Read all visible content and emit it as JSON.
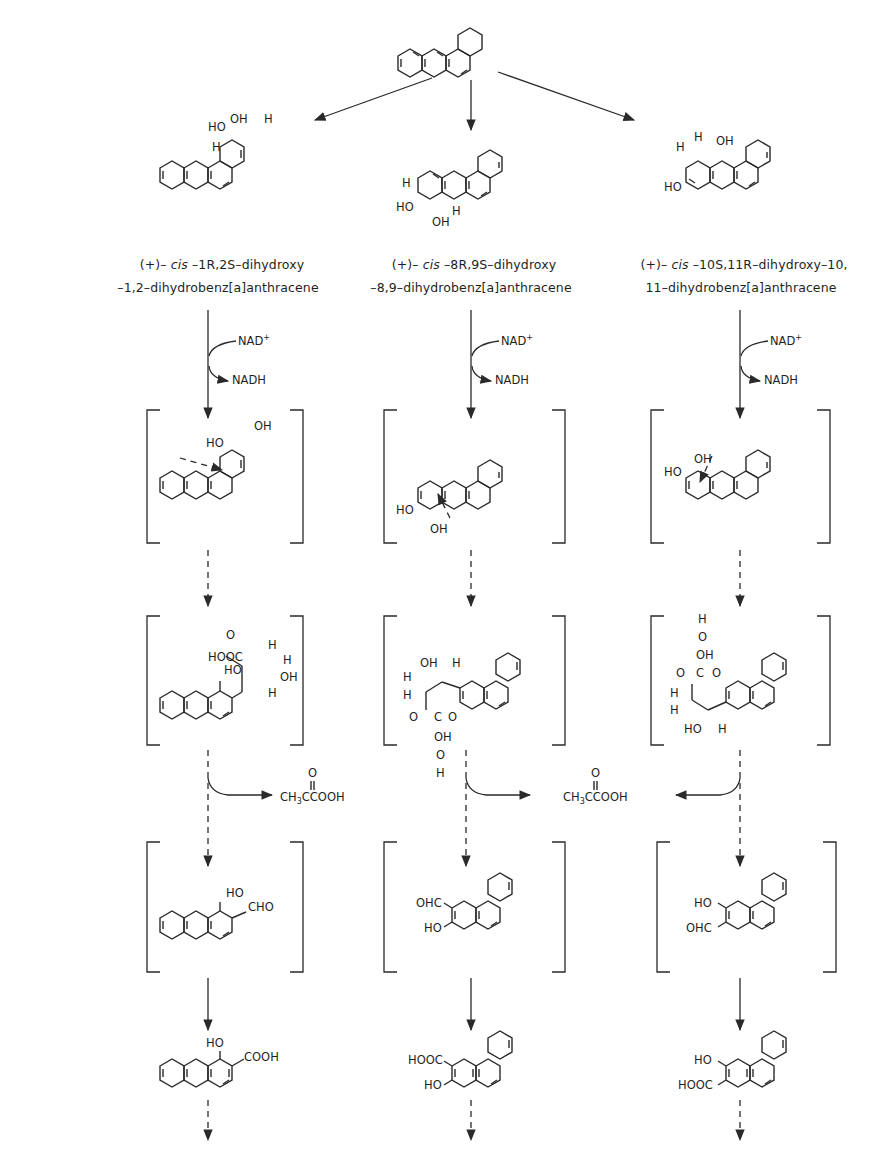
{
  "diagram": {
    "type": "metabolic pathway scheme",
    "substrate": {
      "name": "benz[a]anthracene",
      "role": "starting compound"
    },
    "branches": [
      {
        "id": "left",
        "dihydrodiol_name_line1_prefix": "(+)–",
        "dihydrodiol_name_line1_cis": "cis",
        "dihydrodiol_name_line1_suffix": "–1R,2S–dihydroxy",
        "dihydrodiol_name_line2": "–1,2–dihydrobenz[a]anthracene",
        "cofactor_in": "NAD+",
        "cofactor_out": "NADH",
        "catechol": {
          "substituents": [
            "HO",
            "OH"
          ],
          "bracketed": true
        },
        "ring_fission_product": {
          "substituents": [
            "HOOC",
            "O",
            "H",
            "H",
            "HO",
            "OH",
            "H"
          ],
          "bracketed": true
        },
        "aldehyde": {
          "substituents": [
            "HO",
            "CHO"
          ],
          "bracketed": true
        },
        "acid": {
          "substituents": [
            "HO",
            "COOH"
          ]
        }
      },
      {
        "id": "middle",
        "dihydrodiol_name_line1_prefix": "(+)–",
        "dihydrodiol_name_line1_cis": "cis",
        "dihydrodiol_name_line1_suffix": "–8R,9S–dihydroxy",
        "dihydrodiol_name_line2": "–8,9–dihydrobenz[a]anthracene",
        "cofactor_in": "NAD+",
        "cofactor_out": "NADH",
        "catechol": {
          "substituents": [
            "HO",
            "OH"
          ],
          "bracketed": true
        },
        "ring_fission_product": {
          "substituents": [
            "OH",
            "H",
            "H",
            "H",
            "O",
            "C",
            "O",
            "OH",
            "O",
            "H"
          ],
          "bracketed": true
        },
        "aldehyde": {
          "substituents": [
            "OHC",
            "HO"
          ],
          "bracketed": true
        },
        "acid": {
          "substituents": [
            "HOOC",
            "HO"
          ]
        }
      },
      {
        "id": "right",
        "dihydrodiol_name_line1_prefix": "(+)–",
        "dihydrodiol_name_line1_cis": "cis",
        "dihydrodiol_name_line1_suffix": "–10S,11R–dihydroxy–10,",
        "dihydrodiol_name_line2": "11–dihydrobenz[a]anthracene",
        "cofactor_in": "NAD+",
        "cofactor_out": "NADH",
        "catechol": {
          "substituents": [
            "HO",
            "OH"
          ],
          "bracketed": true
        },
        "ring_fission_product": {
          "substituents": [
            "H",
            "O",
            "OH",
            "O",
            "C",
            "O",
            "H",
            "H",
            "HO",
            "H"
          ],
          "bracketed": true
        },
        "aldehyde": {
          "substituents": [
            "HO",
            "OHC"
          ],
          "bracketed": true
        },
        "acid": {
          "substituents": [
            "HO",
            "HOOC"
          ]
        }
      }
    ],
    "byproduct": {
      "formula_main": "CH",
      "formula_sub": "3",
      "formula_tail": "CCOOH",
      "carbonyl_o": "O",
      "name": "pyruvic acid"
    },
    "labels": {
      "nad": "NAD",
      "nad_sup": "+",
      "nadh": "NADH",
      "oh": "OH",
      "ho": "HO",
      "h": "H",
      "o": "O",
      "c": "C",
      "cho": "CHO",
      "ohc": "OHC",
      "cooh": "COOH",
      "hooc": "HOOC",
      "hooc_alt": "HOOC"
    }
  }
}
